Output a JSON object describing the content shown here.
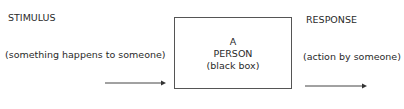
{
  "stimulus": {
    "heading": "STIMULUS",
    "description": "(something happens to someone)"
  },
  "person": {
    "line1": "A",
    "line2": "PERSON",
    "line3": "(black box)"
  },
  "response": {
    "heading": "RESPONSE",
    "description": "(action by someone)"
  }
}
